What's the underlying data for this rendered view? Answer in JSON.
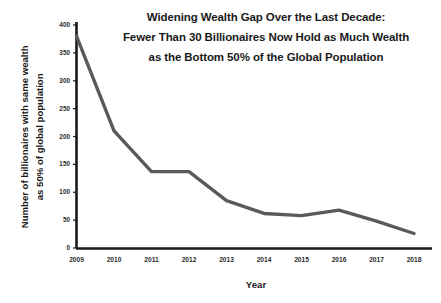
{
  "chart_data": {
    "type": "line",
    "title": "Widening Wealth Gap Over the Last Decade: Fewer Than 30 Billionaires Now Hold as Much Wealth as the Bottom 50% of the Global Population",
    "title_lines": [
      "Widening Wealth Gap Over the Last Decade:",
      "Fewer Than 30 Billionaires Now Hold as Much Wealth",
      "as the Bottom 50% of the Global Population"
    ],
    "xlabel": "Year",
    "ylabel": "Number of billionaires with same wealth as 50% of global population",
    "ylabel_lines": [
      "Number of billionaires with same wealth",
      "as 50% of global population"
    ],
    "categories": [
      "2009",
      "2010",
      "2011",
      "2012",
      "2013",
      "2014",
      "2015",
      "2016",
      "2017",
      "2018"
    ],
    "values": [
      380,
      210,
      137,
      137,
      85,
      62,
      58,
      68,
      48,
      26
    ],
    "ylim": [
      0,
      400
    ],
    "yticks": [
      0,
      50,
      100,
      150,
      200,
      250,
      300,
      350,
      400
    ],
    "grid": false,
    "legend": "none",
    "line_color": "#5a5a5a",
    "axis_color": "#1a1a1a",
    "background": "#ffffff"
  }
}
